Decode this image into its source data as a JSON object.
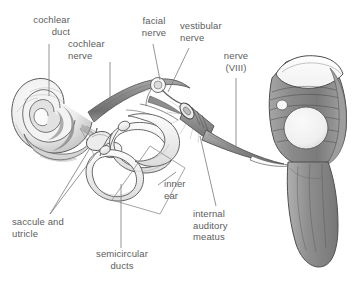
{
  "figure": {
    "kind": "anatomical-illustration",
    "style": "pencil-shaded grayscale line drawing",
    "background_color": "#ffffff",
    "label_color": "#5d5d5d",
    "leader_color": "#6a6a6a",
    "ink_color": "#4a4a4a"
  },
  "labels": {
    "cochlear_duct": "cochlear\nduct",
    "cochlear_nerve": "cochlear\nnerve",
    "facial_nerve": "facial\nnerve",
    "vestibular_nerve": "vestibular\nnerve",
    "nerve_viii": "nerve\n(VIII)",
    "inner_ear": "inner\near",
    "internal_auditory_meatus": "internal\nauditory\nmeatus",
    "saccule_and_utricle": "saccule and\nutricle",
    "semicircular_ducts": "semicircular\nducts"
  },
  "structures": [
    {
      "name": "cochlea",
      "description": "spiral snail-shell shaped cochlea at left"
    },
    {
      "name": "cochlear-nerve-trunk",
      "description": "thick shaded nerve band running right from cochlea"
    },
    {
      "name": "semicircular-ducts",
      "description": "three looping membranous ducts"
    },
    {
      "name": "saccule-and-utricle",
      "description": "vestibule sacs between cochlea and ducts"
    },
    {
      "name": "facial-nerve",
      "description": "small nerve loop above the trunk"
    },
    {
      "name": "vestibular-nerve",
      "description": "branch joining the trunk from the labyrinth"
    },
    {
      "name": "internal-auditory-meatus",
      "description": "cut cylindrical bony canal around the nerve"
    },
    {
      "name": "nerve-viii",
      "description": "vestibulocochlear nerve entering the brainstem"
    },
    {
      "name": "brainstem",
      "description": "pons and medulla with cut surface at top"
    },
    {
      "name": "inner-ear-outline",
      "description": "quadrilateral bracket enclosing the labyrinth"
    }
  ]
}
